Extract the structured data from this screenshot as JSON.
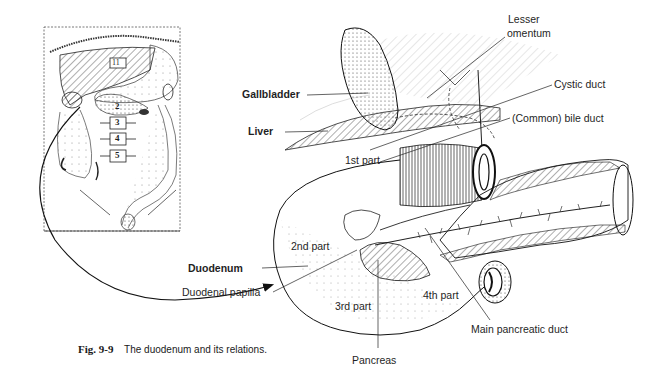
{
  "figure": {
    "number": "Fig. 9-9",
    "caption": "The duodenum and its relations."
  },
  "inset": {
    "title": "Overview of abdomen with vertebral levels",
    "vertebrae": [
      "11",
      "2",
      "3",
      "4",
      "5"
    ]
  },
  "labels": {
    "lesser_omentum": [
      "Lesser",
      "omentum"
    ],
    "gallbladder": "Gallbladder",
    "cystic_duct": "Cystic duct",
    "liver": "Liver",
    "common_bile_duct": "(Common) bile duct",
    "first_part": "1st part",
    "second_part": "2nd part",
    "third_part": "3rd part",
    "fourth_part": "4th part",
    "duodenum": "Duodenum",
    "duodenal_papilla": "Duodenal papilla",
    "pancreas": "Pancreas",
    "main_pancreatic_duct": "Main pancreatic duct"
  },
  "colors": {
    "ink": "#1a1a1a",
    "paper": "#ffffff"
  }
}
